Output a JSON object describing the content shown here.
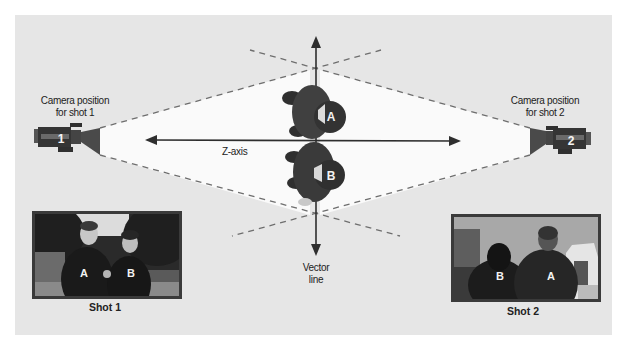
{
  "diagram": {
    "camera_left": {
      "label_line1": "Camera position",
      "label_line2": "for shot 1",
      "number": "1"
    },
    "camera_right": {
      "label_line1": "Camera position",
      "label_line2": "for shot 2",
      "number": "2"
    },
    "subjects": {
      "a": "A",
      "b": "B"
    },
    "z_axis_label": "Z-axis",
    "vector_line_label_line1": "Vector",
    "vector_line_label_line2": "line",
    "shot1": {
      "caption": "Shot 1",
      "left_person": "A",
      "right_person": "B"
    },
    "shot2": {
      "caption": "Shot 2",
      "left_person": "B",
      "right_person": "A"
    },
    "colors": {
      "panel": "#e6e6e6",
      "camera": "#3c3c3c",
      "frustum": "#fafafa",
      "axis": "#2e2e2e",
      "dashes": "#6e6e6e"
    }
  }
}
